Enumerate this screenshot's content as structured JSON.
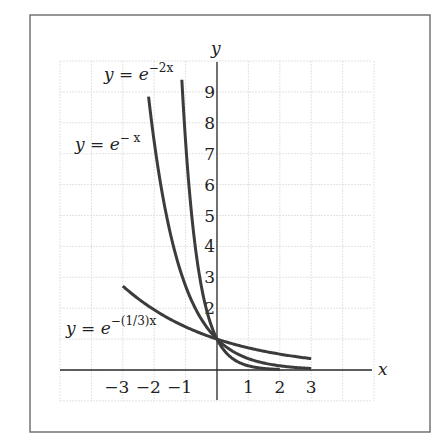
{
  "chart_data": {
    "type": "line",
    "title": "",
    "xlabel": "x",
    "ylabel": "y",
    "xlim": [
      -5,
      5
    ],
    "ylim": [
      -1,
      10
    ],
    "grid": true,
    "x_ticks": [
      -3,
      -2,
      -1,
      1,
      2,
      3
    ],
    "x_tick_labels": [
      "−3",
      "−2",
      "−1",
      "1",
      "2",
      "3"
    ],
    "y_ticks": [
      2,
      3,
      4,
      5,
      6,
      7,
      8,
      9
    ],
    "y_tick_labels": [
      "2",
      "3",
      "4",
      "5",
      "6",
      "7",
      "8",
      "9"
    ],
    "series": [
      {
        "name": "y = e^(-2x)",
        "label_base": "y = e",
        "label_exp": "−2x",
        "x_range": [
          -1.12,
          2
        ],
        "k": 2
      },
      {
        "name": "y = e^(-x)",
        "label_base": "y = e",
        "label_exp": "− x",
        "x_range": [
          -2.18,
          3
        ],
        "k": 1
      },
      {
        "name": "y = e^(-(1/3)x)",
        "label_base": "y = e",
        "label_exp": "−(1/3)x",
        "x_range": [
          -3,
          3
        ],
        "k": 0.3333
      }
    ],
    "intersection": {
      "x": 0,
      "y": 1
    }
  }
}
